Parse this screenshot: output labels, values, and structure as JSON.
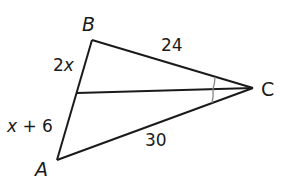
{
  "diagram": {
    "type": "triangle-with-angle-bisector",
    "stroke_color": "#1a1a1a",
    "arc_color": "#888888",
    "vertices": {
      "A": {
        "label": "A",
        "x": 57,
        "y": 160
      },
      "B": {
        "label": "B",
        "x": 92,
        "y": 40
      },
      "C": {
        "label": "C",
        "x": 253,
        "y": 88
      }
    },
    "bisector_foot": {
      "x": 77,
      "y": 93
    },
    "segment_labels": {
      "BD": {
        "coefficient": "2",
        "variable": "x"
      },
      "DA": {
        "variable": "x",
        "rest": " + 6"
      },
      "BC": "24",
      "AC": "30"
    },
    "angle_marks": "congruent angles at C (bisected)"
  }
}
